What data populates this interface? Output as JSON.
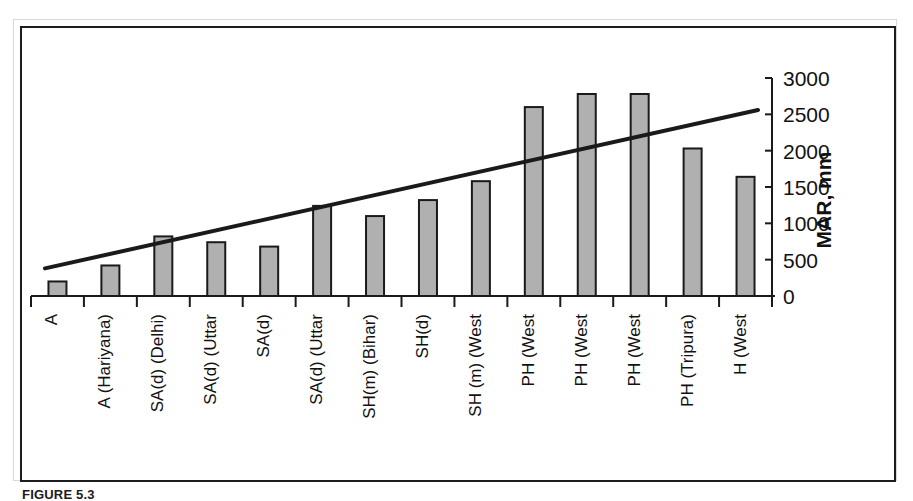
{
  "figure": {
    "caption": "FIGURE 5.3",
    "frame_color": "#1d1d1d"
  },
  "chart_data": {
    "type": "bar",
    "title": "",
    "xlabel": "",
    "ylabel": "MAR, mm",
    "ylim": [
      0,
      3000
    ],
    "ytick_values": [
      0,
      500,
      1000,
      1500,
      2000,
      2500,
      3000
    ],
    "ytick_labels": [
      "0",
      "500",
      "1000",
      "1500",
      "2000",
      "2500",
      "3000"
    ],
    "yaxis_position": "right",
    "grid": false,
    "legend": false,
    "bar_face_color": "#b0b0b0",
    "bar_edge_color": "#1a1a1a",
    "trend_line_color": "#1a1a1a",
    "categories": [
      "A",
      "A (Hariyana)",
      "SA(d) (Delhi)",
      "SA(d) (Uttar",
      "SA(d)",
      "SA(d) (Uttar",
      "SH(m) (Bihar)",
      "SH(d)",
      "SH (m) (West",
      "PH (West",
      "PH (West",
      "PH (West",
      "PH (Tripura)",
      "H (West"
    ],
    "series": [
      {
        "name": "MAR",
        "values": [
          200,
          420,
          820,
          740,
          680,
          1240,
          1100,
          1320,
          1580,
          2600,
          2780,
          2780,
          2030,
          1640
        ]
      }
    ],
    "trend_line": {
      "name": "Linear trend",
      "start_value": 380,
      "end_value": 2560
    }
  }
}
